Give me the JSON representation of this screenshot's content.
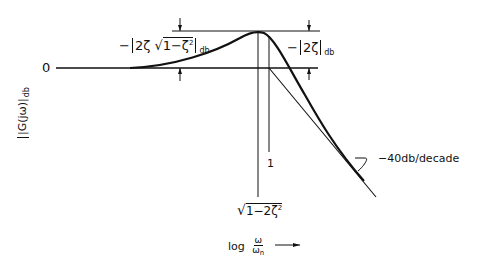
{
  "diagram": {
    "type": "bode-magnitude-second-order",
    "zero_label": "0",
    "y_axis_label": "|G(jω)|",
    "y_axis_label_sub": "db",
    "peak_label_left": {
      "prefix": "−",
      "content": "2ζ",
      "sqrt_content": "1−ζ",
      "sqrt_power": "2",
      "subscript": "db"
    },
    "peak_label_right": {
      "prefix": "−",
      "content": "2ζ",
      "subscript": "db"
    },
    "corner_label": "1",
    "peak_frequency_label": {
      "sqrt_content": "1−2ζ",
      "power": "2"
    },
    "x_axis_label": {
      "prefix": "log",
      "numerator": "ω",
      "denominator": "ω",
      "denominator_sub": "n",
      "arrow": "⟶"
    },
    "slope_label": "−40db/decade",
    "colors": {
      "ink": "#111111",
      "background": "#ffffff"
    }
  }
}
